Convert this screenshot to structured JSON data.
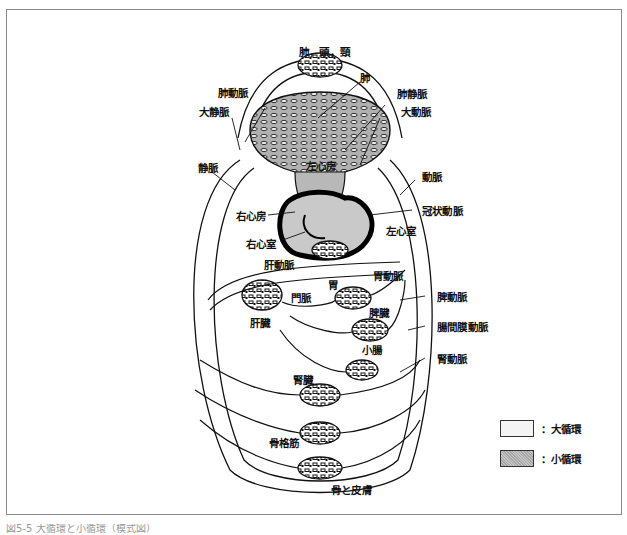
{
  "figure": {
    "caption": "図5-5 大循環と小循環（模式図）",
    "colors": {
      "systemic_fill": "#f4f4f4",
      "pulmonary_fill": "#b8b8b8",
      "stroke": "#111111",
      "heart_wall": "#000000"
    }
  },
  "labels": {
    "lung_head_neck": "肺，頭，頸",
    "lung": "肺",
    "pulmonary_artery": "肺動脈",
    "pulmonary_vein": "肺静脈",
    "vena_cava": "大静脈",
    "aorta": "大動脈",
    "left_atrium": "左心房",
    "vein": "静脈",
    "artery": "動脈",
    "right_atrium": "右心房",
    "coronary_artery": "冠状動脈",
    "left_ventricle": "左心室",
    "right_ventricle": "右心室",
    "hepatic_artery": "肝動脈",
    "stomach": "胃",
    "gastric_artery": "胃動脈",
    "portal_vein": "門脈",
    "splenic_artery": "脾動脈",
    "liver": "肝臓",
    "spleen": "脾臓",
    "mesenteric_artery": "腸間膜動脈",
    "small_intestine": "小腸",
    "renal_artery": "腎動脈",
    "kidney": "腎臓",
    "skeletal_muscle": "骨格筋",
    "bone_and_skin": "骨と皮膚"
  },
  "legend": {
    "items": [
      {
        "label": "：大循環",
        "kind": "systemic"
      },
      {
        "label": "：小循環",
        "kind": "pulmonary"
      }
    ]
  }
}
